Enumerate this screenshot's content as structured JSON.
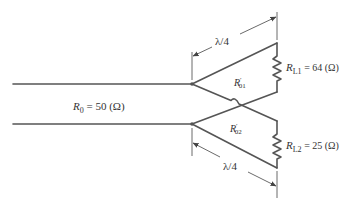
{
  "diagram": {
    "type": "circuit-schematic",
    "main_line": {
      "label_var": "R",
      "label_sub": "0",
      "label_rest": " = 50 (Ω)"
    },
    "branch_1": {
      "impedance_var": "R",
      "impedance_sub": "01",
      "impedance_prime": "′",
      "length_label": "λ/4",
      "load_var": "R",
      "load_sub": "L1",
      "load_rest": " = 64 (Ω)"
    },
    "branch_2": {
      "impedance_var": "R",
      "impedance_sub": "02",
      "impedance_prime": "′",
      "length_label": "λ/4",
      "load_var": "R",
      "load_sub": "L2",
      "load_rest": " = 25 (Ω)"
    },
    "colors": {
      "wire": "#555555",
      "text": "#333333",
      "background": "#ffffff"
    }
  }
}
